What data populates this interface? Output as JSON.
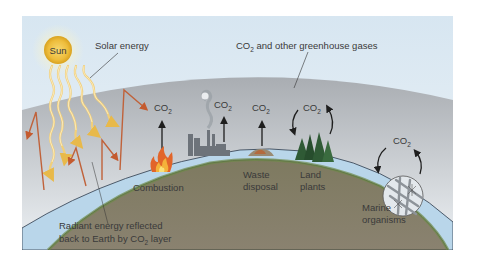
{
  "diagram": {
    "colors": {
      "sky_top": "#dce9f3",
      "sky_bottom": "#eef3f8",
      "atmosphere_layer": "#b3b7bc",
      "earth_ground": "#7f7a62",
      "earth_edge": "#6f8a48",
      "ocean": "#b9d6ea",
      "sun": "#f3c646",
      "solar_ray": "#f1cf7a",
      "reflected_ray": "#c0623a",
      "text": "#3a3a3a"
    },
    "labels": {
      "sun": "Sun",
      "solar_energy": "Solar energy",
      "greenhouse_gases_prefix": "CO",
      "greenhouse_gases_sub": "2",
      "greenhouse_gases_suffix": " and other greenhouse gases",
      "radiant_line1": "Radiant energy reflected",
      "radiant_line2_prefix": "back to Earth by CO",
      "radiant_line2_sub": "2",
      "radiant_line2_suffix": " layer",
      "combustion": "Combustion",
      "waste_line1": "Waste",
      "waste_line2": "disposal",
      "land_line1": "Land",
      "land_line2": "plants",
      "marine_line1": "Marine",
      "marine_line2": "organisms"
    },
    "co2_markers": [
      {
        "source": "combustion",
        "main": "CO",
        "sub": "2",
        "flow": "emission"
      },
      {
        "source": "industry",
        "main": "CO",
        "sub": "2",
        "flow": "emission"
      },
      {
        "source": "waste_disposal",
        "main": "CO",
        "sub": "2",
        "flow": "emission"
      },
      {
        "source": "land_plants",
        "main": "CO",
        "sub": "2",
        "flow": "cycle"
      },
      {
        "source": "marine_organisms",
        "main": "CO",
        "sub": "2",
        "flow": "cycle"
      }
    ]
  }
}
